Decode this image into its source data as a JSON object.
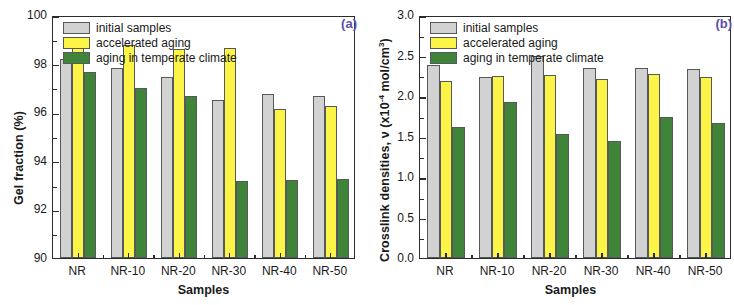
{
  "figure": {
    "panels": [
      {
        "tag": "(a)",
        "tag_color": "#5b4fa8",
        "ylabel": "Gel fraction (%)",
        "xlabel": "Samples"
      },
      {
        "tag": "(b)",
        "tag_color": "#5b4fa8",
        "ylabel_pre": "Crosslink densities, ν (x10",
        "ylabel_sup": "-4",
        "ylabel_post": " mol/cm",
        "ylabel_sup2": "3",
        "ylabel_end": ")",
        "xlabel": "Samples"
      }
    ],
    "legend": [
      {
        "label": "initial samples",
        "color": "#d2d2d2"
      },
      {
        "label": "accelerated aging",
        "color": "#fcf447"
      },
      {
        "label": "aging in temperate climate",
        "color": "#3f8438"
      }
    ]
  },
  "chart_data": [
    {
      "type": "bar",
      "title": "(a)",
      "xlabel": "Samples",
      "ylabel": "Gel fraction (%)",
      "ylim": [
        90,
        100
      ],
      "yticks": [
        90,
        92,
        94,
        96,
        98,
        100
      ],
      "ytick_labels": [
        "90",
        "92",
        "94",
        "96",
        "98",
        "100"
      ],
      "minor_ticks": true,
      "grid": false,
      "legend_position": "top-left",
      "categories": [
        "NR",
        "NR-10",
        "NR-20",
        "NR-30",
        "NR-40",
        "NR-50"
      ],
      "series": [
        {
          "name": "initial samples",
          "color": "#d2d2d2",
          "values": [
            98.2,
            97.8,
            97.45,
            96.5,
            96.75,
            96.65
          ]
        },
        {
          "name": "accelerated aging",
          "color": "#fcf447",
          "values": [
            98.65,
            98.75,
            98.6,
            98.65,
            96.15,
            96.25
          ]
        },
        {
          "name": "aging in temperate climate",
          "color": "#3f8438",
          "values": [
            97.65,
            97.0,
            96.65,
            93.15,
            93.2,
            93.25
          ]
        }
      ]
    },
    {
      "type": "bar",
      "title": "(b)",
      "xlabel": "Samples",
      "ylabel": "Crosslink densities, ν (x10⁻⁴ mol/cm³)",
      "ylim": [
        0.0,
        3.0
      ],
      "yticks": [
        0.0,
        0.5,
        1.0,
        1.5,
        2.0,
        2.5,
        3.0
      ],
      "ytick_labels": [
        "0.0",
        "0.5",
        "1.0",
        "1.5",
        "2.0",
        "2.5",
        "3.0"
      ],
      "minor_ticks": true,
      "grid": false,
      "legend_position": "top-left",
      "categories": [
        "NR",
        "NR-10",
        "NR-20",
        "NR-30",
        "NR-40",
        "NR-50"
      ],
      "series": [
        {
          "name": "initial samples",
          "color": "#d2d2d2",
          "values": [
            2.38,
            2.23,
            2.5,
            2.34,
            2.34,
            2.33
          ]
        },
        {
          "name": "accelerated aging",
          "color": "#fcf447",
          "values": [
            2.18,
            2.25,
            2.26,
            2.21,
            2.27,
            2.24
          ]
        },
        {
          "name": "aging in temperate climate",
          "color": "#3f8438",
          "values": [
            1.62,
            1.92,
            1.53,
            1.45,
            1.74,
            1.67
          ]
        }
      ]
    }
  ]
}
